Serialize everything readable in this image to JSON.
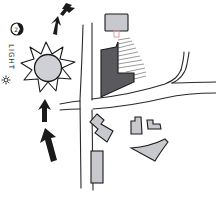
{
  "diagram": {
    "label": "LIGHT",
    "legend_icon": "small-sun-icon",
    "compass_icon": "north-compass-icon",
    "compass_number": "2",
    "colors": {
      "ink": "#1a1a1a",
      "building_fill": "#c8c9cf",
      "main_building_fill": "#5a5a5e",
      "hatch": "#555555",
      "connector": "#e0a0a0",
      "sun_fill": "#cfd0d6"
    },
    "elements": [
      {
        "type": "arrow",
        "name": "light-direction-arrow",
        "count": 4
      },
      {
        "type": "sun",
        "name": "sun-icon"
      },
      {
        "type": "road",
        "name": "vertical-road"
      },
      {
        "type": "road",
        "name": "horizontal-road"
      },
      {
        "type": "road",
        "name": "curved-branch-road"
      },
      {
        "type": "building",
        "name": "main-building-shaded"
      },
      {
        "type": "building",
        "name": "top-building"
      },
      {
        "type": "building",
        "name": "stepped-building"
      },
      {
        "type": "building",
        "name": "tall-rect-building"
      },
      {
        "type": "building",
        "name": "small-building-left"
      },
      {
        "type": "building",
        "name": "small-building-right"
      },
      {
        "type": "building",
        "name": "wedge-building"
      }
    ]
  }
}
